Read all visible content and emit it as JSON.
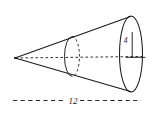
{
  "figure": {
    "type": "geometry-diagram",
    "shape": "cone",
    "orientation": "horizontal-apex-left",
    "background_color": "#ffffff",
    "stroke_color": "#1a1a1a"
  },
  "labels": {
    "radius": "4",
    "length": "12"
  },
  "annotations": {
    "radius_label_name": "radius-label",
    "length_label_name": "length-label"
  },
  "elements": {
    "apex_name": "cone-apex",
    "base_ellipse_name": "cone-base-ellipse",
    "cross_section_name": "cone-cross-section-ellipse",
    "upper_slant_name": "cone-upper-slant-line",
    "lower_slant_name": "cone-lower-slant-line",
    "axis_name": "cone-axis-dashed-line",
    "radius_line_name": "cone-radius-line",
    "dimension_line_name": "cone-length-dimension-line"
  }
}
